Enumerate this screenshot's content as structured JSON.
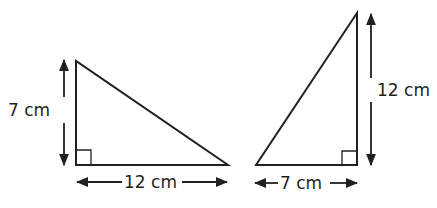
{
  "diagram": {
    "stroke_color": "#231f20",
    "triangles": [
      {
        "name": "left-triangle",
        "height_label": "7 cm",
        "base_label": "12 cm",
        "height": 7,
        "base": 12,
        "unit": "cm",
        "right_angle": "bottom-left"
      },
      {
        "name": "right-triangle",
        "height_label": "12 cm",
        "base_label": "7 cm",
        "height": 12,
        "base": 7,
        "unit": "cm",
        "right_angle": "bottom-right"
      }
    ]
  }
}
